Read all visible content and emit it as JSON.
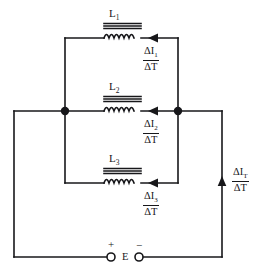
{
  "diagram": {
    "type": "electrical-schematic",
    "stroke_color": "#17171a",
    "background_color": "#ffffff",
    "width": 268,
    "height": 275
  },
  "components": {
    "inductors": [
      {
        "id": "L1",
        "label": "L",
        "sub": "1",
        "label_x": 112,
        "label_y": 14,
        "core_lines": 3,
        "coil_loops": 4,
        "branch_y": 38
      },
      {
        "id": "L2",
        "label": "L",
        "sub": "2",
        "label_x": 112,
        "label_y": 87,
        "core_lines": 3,
        "coil_loops": 4,
        "branch_y": 111
      },
      {
        "id": "L3",
        "label": "L",
        "sub": "3",
        "label_x": 112,
        "label_y": 159,
        "core_lines": 3,
        "coil_loops": 4,
        "branch_y": 183
      }
    ],
    "source": {
      "id": "E",
      "label": "E",
      "plus_sign": "+",
      "minus_sign": "−",
      "terminal_left_x": 111,
      "terminal_right_x": 139,
      "terminal_y": 257,
      "terminal_radius": 4
    },
    "junction_dots": [
      {
        "name": "left-node",
        "x": 65,
        "y": 111
      },
      {
        "name": "right-node",
        "x": 178,
        "y": 111
      }
    ]
  },
  "current_labels": [
    {
      "id": "dI1",
      "numerator_main": "ΔI",
      "numerator_sub": "1",
      "denominator": "ΔT",
      "x": 150,
      "y": 42
    },
    {
      "id": "dI2",
      "numerator_main": "ΔI",
      "numerator_sub": "2",
      "denominator": "ΔT",
      "x": 150,
      "y": 116
    },
    {
      "id": "dI3",
      "numerator_main": "ΔI",
      "numerator_sub": "3",
      "denominator": "ΔT",
      "x": 150,
      "y": 188
    },
    {
      "id": "dIT",
      "numerator_main": "ΔI",
      "numerator_sub": "T",
      "denominator": "ΔT",
      "x": 232,
      "y": 166
    }
  ],
  "arrows": [
    {
      "name": "arrow-branch-1",
      "x": 150,
      "y": 38,
      "direction": "left"
    },
    {
      "name": "arrow-branch-2",
      "x": 150,
      "y": 111,
      "direction": "left"
    },
    {
      "name": "arrow-branch-3",
      "x": 150,
      "y": 183,
      "direction": "left"
    },
    {
      "name": "arrow-total",
      "x": 222,
      "y": 183,
      "direction": "up"
    }
  ],
  "geometry": {
    "outer_left_x": 14,
    "outer_right_x": 222,
    "outer_bottom_y": 257,
    "node_left_x": 65,
    "node_right_x": 178,
    "node_y": 111,
    "branch_top_y": 38,
    "branch_bottom_y": 183
  }
}
